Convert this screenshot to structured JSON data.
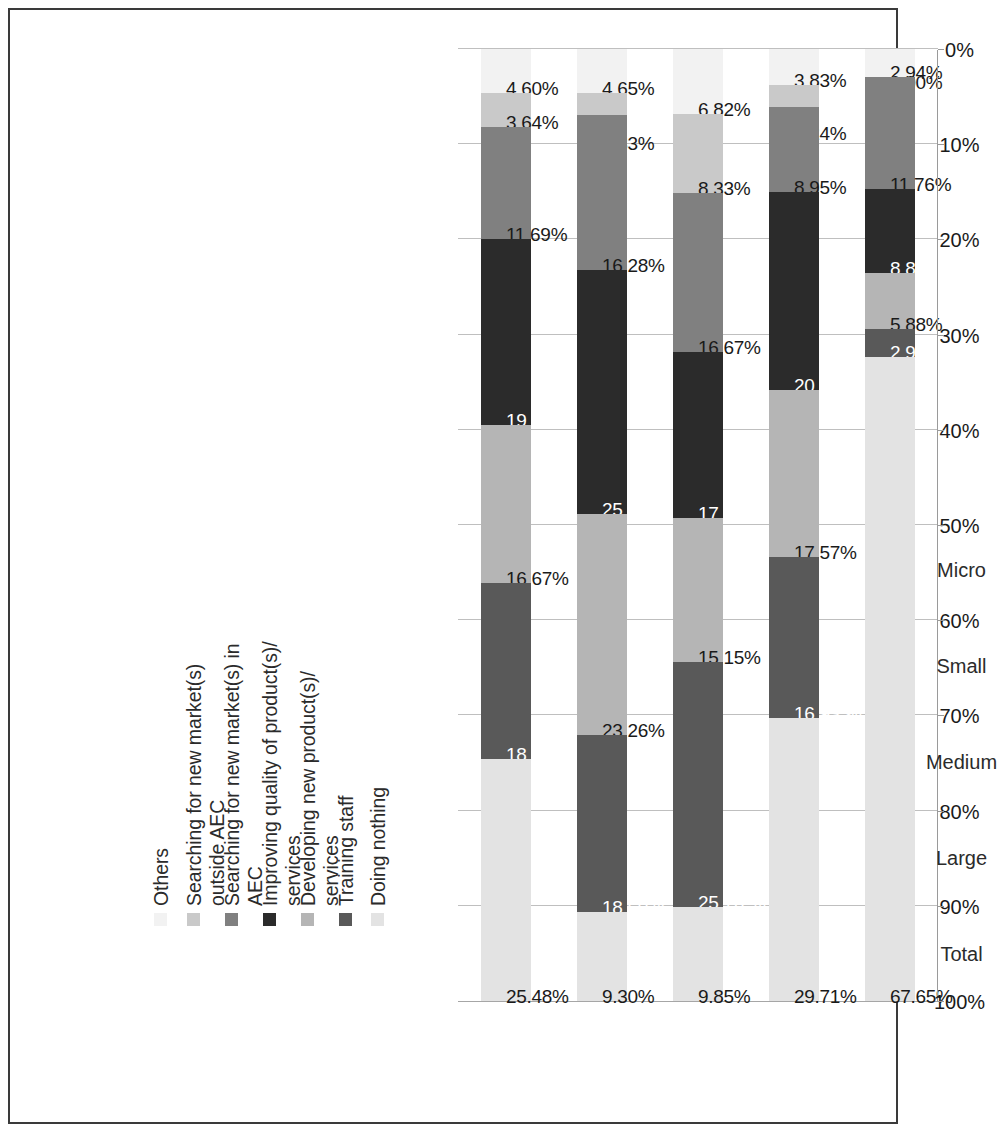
{
  "chart_data": {
    "type": "bar",
    "stacked": true,
    "stack_mode": "percent",
    "orientation": "horizontal-rotated",
    "title": "",
    "xlabel": "",
    "ylabel": "",
    "ylim": [
      0,
      100
    ],
    "grid": true,
    "legend_position": "top",
    "axis_ticks": [
      "100%",
      "90%",
      "80%",
      "70%",
      "60%",
      "50%",
      "40%",
      "30%",
      "20%",
      "10%",
      "0%"
    ],
    "axis_tick_values": [
      100,
      90,
      80,
      70,
      60,
      50,
      40,
      30,
      20,
      10,
      0
    ],
    "categories": [
      "Micro",
      "Small",
      "Medium",
      "Large",
      "Total"
    ],
    "series": [
      {
        "name": "Others",
        "color": "#f2f2f2",
        "values": [
          2.94,
          3.83,
          6.82,
          4.65,
          4.6
        ],
        "labels": [
          "2.94%",
          "3.83%",
          "6.82%",
          "4.65%",
          "4.60%"
        ]
      },
      {
        "name": "Searching for new market(s)\noutside AEC",
        "color": "#c9c9c9",
        "values": [
          0.0,
          2.24,
          8.33,
          2.33,
          3.64
        ],
        "labels": [
          "0.00%",
          "2.24%",
          "8.33%",
          "2.33%",
          "3.64%"
        ]
      },
      {
        "name": "Searching for new market(s) in\nAEC",
        "color": "#808080",
        "values": [
          11.76,
          8.95,
          16.67,
          16.28,
          11.69
        ],
        "labels": [
          "11.76%",
          "8.95%",
          "16.67%",
          "16.28%",
          "11.69%"
        ]
      },
      {
        "name": "Improving quality of product(s)/\nservices",
        "color": "#2b2b2b",
        "values": [
          8.82,
          20.77,
          17.42,
          25.58,
          19.54
        ],
        "labels": [
          "8.82 %",
          "20.77 %",
          "17.42 %",
          "25.58 %",
          "19.54 %"
        ]
      },
      {
        "name": "Developing new product(s)/\nservices",
        "color": "#b5b5b5",
        "values": [
          5.88,
          17.57,
          15.15,
          23.26,
          16.67
        ],
        "labels": [
          "5.88%",
          "17.57%",
          "15.15%",
          "23.26%",
          "16.67%"
        ]
      },
      {
        "name": "Training staff",
        "color": "#595959",
        "values": [
          2.94,
          16.93,
          25.76,
          18.6,
          18.39
        ],
        "labels": [
          "2.94%",
          "16.93 %",
          "25.76 %",
          "18.60 %",
          "18.39 %"
        ]
      },
      {
        "name": "Doing nothing",
        "color": "#e3e3e3",
        "values": [
          67.65,
          29.71,
          9.85,
          9.3,
          25.48
        ],
        "labels": [
          "67.65%",
          "29.71%",
          "9.85%",
          "9.30%",
          "25.48%"
        ]
      }
    ]
  },
  "legend": {
    "items": [
      {
        "label": "Others",
        "swatch": "#f2f2f2"
      },
      {
        "label": "Searching for new market(s)\noutside AEC",
        "swatch": "#c9c9c9"
      },
      {
        "label": "Searching for new market(s) in\nAEC",
        "swatch": "#808080"
      },
      {
        "label": "Improving quality of product(s)/\nservices",
        "swatch": "#2b2b2b"
      },
      {
        "label": "Developing new product(s)/\nservices",
        "swatch": "#b5b5b5"
      },
      {
        "label": "Training staff",
        "swatch": "#595959"
      },
      {
        "label": "Doing nothing",
        "swatch": "#e3e3e3"
      }
    ]
  },
  "colors": {
    "frame": "#3a3a3a",
    "gridline": "#bfbfbf",
    "axis": "#9a9a9a",
    "text": "#1a1a1a",
    "background": "#ffffff"
  }
}
